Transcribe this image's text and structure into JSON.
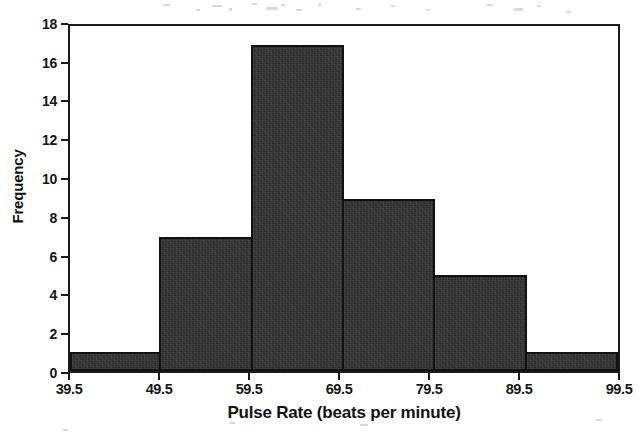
{
  "chart_data": {
    "type": "bar",
    "title": "",
    "subtitle": "",
    "xlabel": "Pulse Rate (beats per minute)",
    "ylabel": "Frequency",
    "categories": [
      "39.5-49.5",
      "49.5-59.5",
      "59.5-69.5",
      "69.5-79.5",
      "79.5-89.5",
      "89.5-99.5"
    ],
    "bin_edges": [
      39.5,
      49.5,
      59.5,
      69.5,
      79.5,
      89.5,
      99.5
    ],
    "values": [
      1,
      7,
      17,
      9,
      5,
      1
    ],
    "xlim": [
      39.5,
      99.5
    ],
    "ylim": [
      0,
      18
    ],
    "x_tick_labels": [
      "39.5",
      "49.5",
      "59.5",
      "69.5",
      "79.5",
      "89.5",
      "99.5"
    ],
    "x_tick_values": [
      39.5,
      49.5,
      59.5,
      69.5,
      79.5,
      89.5,
      99.5
    ],
    "y_tick_labels": [
      "0",
      "2",
      "4",
      "6",
      "8",
      "10",
      "12",
      "14",
      "16",
      "18"
    ],
    "y_tick_values": [
      0,
      2,
      4,
      6,
      8,
      10,
      12,
      14,
      16,
      18
    ],
    "grid": false,
    "legend": false,
    "legend_position": "none",
    "bar_fill_color": "#2c2c2c",
    "bar_edge_color": "#111111",
    "axis_color": "#1a1a1a",
    "background_color": "#ffffff",
    "total_count": 40
  }
}
